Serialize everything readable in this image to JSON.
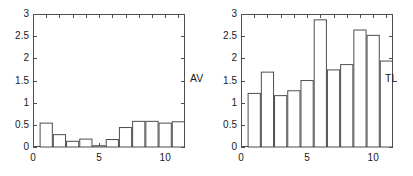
{
  "figure": {
    "width": 413,
    "height": 176,
    "background": "#ffffff",
    "line_color": "#4d4d4d",
    "text_color": "#1a1a1a"
  },
  "chart_data": [
    {
      "type": "bar",
      "title": "",
      "annotation": "AV",
      "xlabel": "",
      "ylabel": "",
      "xlim": [
        0,
        11.5
      ],
      "ylim": [
        0,
        3
      ],
      "grid": false,
      "legend": "none",
      "categories": [
        1,
        2,
        3,
        4,
        5,
        6,
        7,
        8,
        9,
        10,
        11
      ],
      "values": [
        0.55,
        0.29,
        0.14,
        0.19,
        0.04,
        0.18,
        0.45,
        0.59,
        0.59,
        0.55,
        0.58
      ],
      "xticks": [
        0,
        5,
        10
      ],
      "xtick_labels": [
        "0",
        "5",
        "10"
      ],
      "yticks": [
        0,
        0.5,
        1,
        1.5,
        2,
        2.5,
        3
      ],
      "ytick_labels": [
        "0",
        "0.5",
        "1",
        "1.5",
        "2",
        "2.5",
        "3"
      ],
      "bar_facecolor": "#ffffff",
      "bar_edgecolor": "#4d4d4d"
    },
    {
      "type": "bar",
      "title": "",
      "annotation": "TL",
      "xlabel": "",
      "ylabel": "",
      "xlim": [
        0,
        11.5
      ],
      "ylim": [
        0,
        3
      ],
      "grid": false,
      "legend": "none",
      "categories": [
        1,
        2,
        3,
        4,
        5,
        6,
        7,
        8,
        9,
        10,
        11
      ],
      "values": [
        1.22,
        1.7,
        1.17,
        1.28,
        1.51,
        2.88,
        1.75,
        1.87,
        2.65,
        2.53,
        1.95
      ],
      "xticks": [
        0,
        5,
        10
      ],
      "xtick_labels": [
        "0",
        "5",
        "10"
      ],
      "yticks": [
        0,
        0.5,
        1,
        1.5,
        2,
        2.5,
        3
      ],
      "ytick_labels": [
        "0",
        "0.5",
        "1",
        "1.5",
        "2",
        "2.5",
        "3"
      ],
      "bar_facecolor": "#ffffff",
      "bar_edgecolor": "#4d4d4d"
    }
  ]
}
